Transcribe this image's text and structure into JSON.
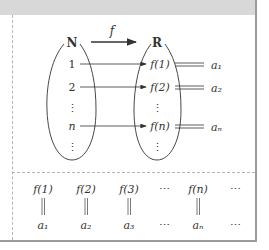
{
  "diagram": {
    "arrow_label": "f",
    "domain_set": {
      "name": "N",
      "elements": [
        "1",
        "2",
        "⋮",
        "n",
        "⋮"
      ]
    },
    "codomain_set": {
      "name": "R",
      "elements": [
        "f(1)",
        "f(2)",
        "⋮",
        "f(n)",
        "⋮"
      ]
    },
    "equals_targets": [
      "a₁",
      "a₂",
      "aₙ"
    ],
    "sequence_table": {
      "top_row": [
        "f(1)",
        "f(2)",
        "f(3)",
        "⋯",
        "f(n)",
        "⋯"
      ],
      "bottom_row": [
        "a₁",
        "a₂",
        "a₃",
        "⋯",
        "aₙ",
        "⋯"
      ],
      "equals_symbol": "‖"
    }
  },
  "colors": {
    "header_band": "#d8d8d8",
    "border": "#9a9a9a",
    "dash": "#b5b5b5",
    "ink": "#333333"
  }
}
